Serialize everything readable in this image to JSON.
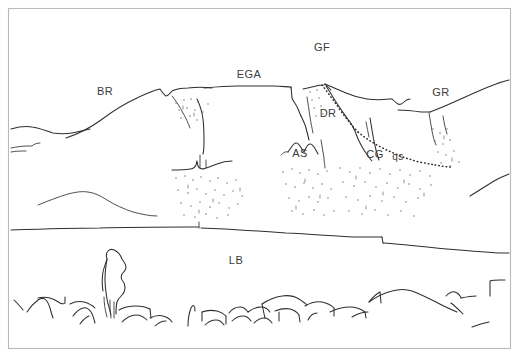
{
  "figure": {
    "kind": "geological-field-sketch",
    "title": "",
    "caption": "",
    "background_color": "#ffffff",
    "line_color": "#2e2e2e",
    "frame_color": "#b9b9b9",
    "label_color": "#3a3a3a"
  },
  "labels": [
    {
      "id": "BR",
      "text": "BR",
      "x": 105,
      "y": 95,
      "size": 11
    },
    {
      "id": "EGA",
      "text": "EGA",
      "x": 249,
      "y": 78,
      "size": 11
    },
    {
      "id": "GF",
      "text": "GF",
      "x": 322,
      "y": 51,
      "size": 11
    },
    {
      "id": "GR",
      "text": "GR",
      "x": 441,
      "y": 96,
      "size": 11
    },
    {
      "id": "DR",
      "text": "DR",
      "x": 328,
      "y": 117,
      "size": 11
    },
    {
      "id": "AS",
      "text": "AS",
      "x": 300,
      "y": 157,
      "size": 11
    },
    {
      "id": "CG",
      "text": "CG",
      "x": 375,
      "y": 158,
      "size": 11
    },
    {
      "id": "qs",
      "text": "qs",
      "x": 398,
      "y": 160,
      "size": 10
    },
    {
      "id": "LB",
      "text": "LB",
      "x": 236,
      "y": 264,
      "size": 11
    }
  ],
  "legend_units": [
    {
      "code": "BR",
      "label": "BR"
    },
    {
      "code": "EGA",
      "label": "EGA"
    },
    {
      "code": "GF",
      "label": "GF"
    },
    {
      "code": "GR",
      "label": "GR"
    },
    {
      "code": "DR",
      "label": "DR"
    },
    {
      "code": "AS",
      "label": "AS"
    },
    {
      "code": "CG",
      "label": "CG"
    },
    {
      "code": "qs",
      "label": "qs"
    },
    {
      "code": "LB",
      "label": "LB"
    }
  ],
  "features": {
    "skyline": "ridge-profile",
    "terrace_line": "mid-slope-break",
    "scree": "stippled-talus-slopes",
    "boulder_field": "lower-block-field",
    "monolith": "standing-rock-pillar",
    "contact": "dotted-geologic-contact"
  }
}
